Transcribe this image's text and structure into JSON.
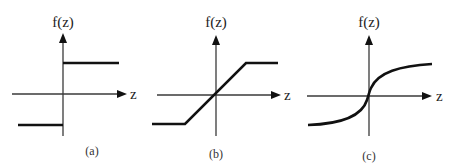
{
  "figure": {
    "panels": [
      {
        "id": "a",
        "caption": "(a)",
        "y_axis_label": "f(z)",
        "x_axis_label": "z",
        "function_type": "step (hard limiter)"
      },
      {
        "id": "b",
        "caption": "(b)",
        "y_axis_label": "f(z)",
        "x_axis_label": "z",
        "function_type": "piecewise linear (saturating ramp)"
      },
      {
        "id": "c",
        "caption": "(c)",
        "y_axis_label": "f(z)",
        "x_axis_label": "z",
        "function_type": "sigmoid-like (odd, saturating curve)"
      }
    ],
    "colors": {
      "axis": "#3a3a3a",
      "curve": "#111111",
      "background": "#ffffff"
    }
  }
}
